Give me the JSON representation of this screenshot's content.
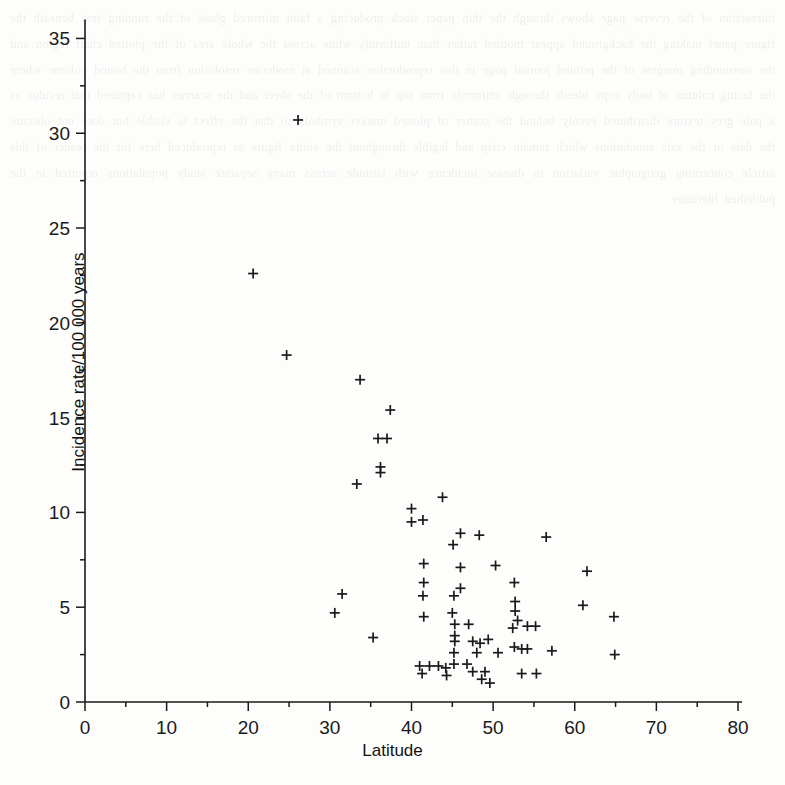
{
  "figure": {
    "title": "",
    "background_color": "#fdfdfc",
    "ink_color": "#1a1a1a",
    "xlabel": "Latitude",
    "ylabel": "Incidence rate/100 000 years"
  },
  "bleed_text": "interaction of the reverse page shows through the thin paper stock producing a faint mirrored ghost of the running text beneath the figure panel making the background appear mottled rather than uniformly white across the whole area of the plotted chart region and the surrounding margins of the printed journal page in this reproduction scanned at moderate resolution from the bound volume where the facing column of body copy bleeds through uniformly from top to bottom of the sheet and the scanner has captured that residue as a pale grey texture distributed evenly behind the scatter of plotted marker symbols so that the effect is visible but does not obscure the data or the axis annotations which remain crisp and legible throughout the entire figure as reproduced here for the reader of this article concerning geographic variation in disease incidence with latitude across many separate study populations reported in the published literature",
  "chart_data": {
    "type": "scatter",
    "title": "",
    "xlabel": "Latitude",
    "ylabel": "Incidence rate/100 000 years",
    "xlim": [
      0,
      80
    ],
    "ylim": [
      0,
      36.5
    ],
    "xticks": [
      0,
      10,
      20,
      30,
      40,
      50,
      60,
      70,
      80
    ],
    "xtick_labels": [
      "0",
      "10",
      "20",
      "30",
      "40",
      "50",
      "60",
      "70",
      "80"
    ],
    "yticks": [
      0,
      5,
      10,
      15,
      20,
      25,
      30,
      35
    ],
    "ytick_labels": [
      "0",
      "5",
      "10",
      "15",
      "20",
      "25",
      "30",
      "35"
    ],
    "x_minor_tick_step": 5,
    "y_minor_tick_step": 2.5,
    "grid": false,
    "legend": null,
    "marker": "plus",
    "marker_color": "#1a1a1a",
    "series": [
      {
        "name": "Studies",
        "points": [
          [
            26.1,
            30.7
          ],
          [
            20.6,
            22.6
          ],
          [
            24.7,
            18.3
          ],
          [
            33.7,
            17.0
          ],
          [
            37.4,
            15.4
          ],
          [
            35.9,
            13.9
          ],
          [
            37.0,
            13.9
          ],
          [
            36.2,
            12.4
          ],
          [
            36.2,
            12.1
          ],
          [
            33.3,
            11.5
          ],
          [
            40.0,
            10.2
          ],
          [
            43.8,
            10.8
          ],
          [
            40.0,
            9.5
          ],
          [
            41.4,
            9.6
          ],
          [
            46.0,
            8.9
          ],
          [
            48.3,
            8.8
          ],
          [
            56.5,
            8.7
          ],
          [
            45.1,
            8.3
          ],
          [
            41.5,
            7.3
          ],
          [
            46.0,
            7.1
          ],
          [
            50.3,
            7.2
          ],
          [
            61.5,
            6.9
          ],
          [
            41.5,
            6.3
          ],
          [
            46.0,
            6.0
          ],
          [
            52.6,
            6.3
          ],
          [
            31.5,
            5.7
          ],
          [
            41.4,
            5.6
          ],
          [
            45.2,
            5.6
          ],
          [
            52.7,
            5.3
          ],
          [
            52.7,
            4.8
          ],
          [
            61.0,
            5.1
          ],
          [
            30.6,
            4.7
          ],
          [
            41.5,
            4.5
          ],
          [
            45.0,
            4.7
          ],
          [
            53.0,
            4.3
          ],
          [
            45.3,
            4.1
          ],
          [
            47.0,
            4.1
          ],
          [
            52.4,
            3.9
          ],
          [
            54.2,
            4.0
          ],
          [
            55.2,
            4.0
          ],
          [
            64.8,
            4.5
          ],
          [
            35.3,
            3.4
          ],
          [
            45.3,
            3.5
          ],
          [
            45.3,
            3.2
          ],
          [
            47.5,
            3.2
          ],
          [
            48.4,
            3.1
          ],
          [
            49.4,
            3.3
          ],
          [
            52.6,
            2.9
          ],
          [
            53.5,
            2.8
          ],
          [
            54.2,
            2.8
          ],
          [
            45.2,
            2.6
          ],
          [
            48.0,
            2.6
          ],
          [
            50.6,
            2.6
          ],
          [
            57.2,
            2.7
          ],
          [
            64.9,
            2.5
          ],
          [
            41.0,
            1.9
          ],
          [
            42.2,
            1.9
          ],
          [
            43.3,
            1.9
          ],
          [
            44.2,
            1.8
          ],
          [
            45.2,
            2.0
          ],
          [
            46.8,
            2.0
          ],
          [
            41.3,
            1.5
          ],
          [
            44.3,
            1.4
          ],
          [
            47.5,
            1.6
          ],
          [
            49.0,
            1.6
          ],
          [
            48.6,
            1.2
          ],
          [
            49.6,
            1.0
          ],
          [
            53.5,
            1.5
          ],
          [
            55.3,
            1.5
          ]
        ]
      }
    ]
  }
}
